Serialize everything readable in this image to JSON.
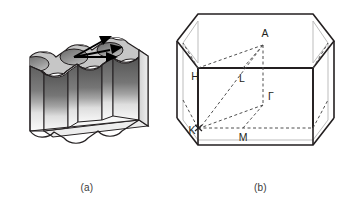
{
  "figure": {
    "background_color": "#ffffff",
    "panels": [
      {
        "id": "a",
        "caption": "(a)",
        "name": "photonic-crystal-slab",
        "description": "Three-dimensional shaded drawing of a patterned slab (photonic crystal) with a triangular lattice of circular holes on the top surface, scalloped side walls, and three black arrows radiating from a point on the top face."
      },
      {
        "id": "b",
        "caption": "(b)",
        "name": "hexagonal-brillouin-zone",
        "description": "Hexagonal prism Brillouin zone with high-symmetry points and dashed symmetry path drawn on the irreducible wedge.",
        "high_symmetry_points": [
          {
            "label": "A",
            "x": 265,
            "y": 37
          },
          {
            "label": "H",
            "x": 198,
            "y": 76
          },
          {
            "label": "L",
            "x": 242,
            "y": 78
          },
          {
            "label": "Γ",
            "x": 271,
            "y": 96
          },
          {
            "label": "K",
            "x": 198,
            "y": 135
          },
          {
            "label": "M",
            "x": 242,
            "y": 136
          }
        ]
      }
    ]
  },
  "colors": {
    "outline": "#231f20",
    "top_face": "#c6c6c6",
    "hole_shadow": "#8a8a8a",
    "wall_dark": "#6f6f6f",
    "wall_light": "#f2f2f2",
    "dashed_line": "#5a5a5a",
    "hidden_edge": "#b9b9b9",
    "label_text": "#231f20",
    "caption_text": "#3a3a3a"
  }
}
